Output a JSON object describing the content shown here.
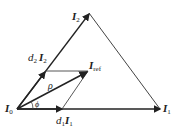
{
  "diagram": {
    "labels": {
      "i0": "I",
      "i0_sub": "0",
      "i1": "I",
      "i1_sub": "1",
      "i2": "I",
      "i2_sub": "2",
      "iref": "I",
      "iref_sub": "ref",
      "d1": "d",
      "d1_sub": "1",
      "d1_vec": "I",
      "d1_vec_sub": "1",
      "d2": "d",
      "d2_sub": "2",
      "d2_vec": "I",
      "d2_vec_sub": "2",
      "rho": "ρ",
      "phi": "ϕ"
    },
    "colors": {
      "line": "#222222"
    }
  }
}
